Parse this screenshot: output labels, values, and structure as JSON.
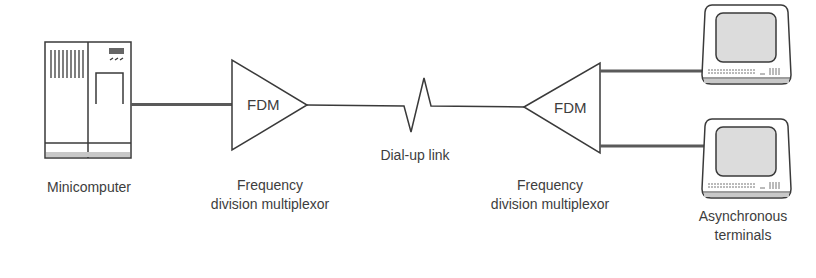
{
  "diagram": {
    "nodes": {
      "minicomputer": {
        "label": "Minicomputer"
      },
      "fdm_left": {
        "box_label": "FDM",
        "caption_line1": "Frequency",
        "caption_line2": "division multiplexor"
      },
      "link": {
        "label": "Dial-up link"
      },
      "fdm_right": {
        "box_label": "FDM",
        "caption_line1": "Frequency",
        "caption_line2": "division multiplexor"
      },
      "terminals": {
        "caption_line1": "Asynchronous",
        "caption_line2": "terminals",
        "count": 2
      }
    },
    "edges": [
      {
        "from": "minicomputer",
        "to": "fdm_left",
        "style": "thick"
      },
      {
        "from": "fdm_left",
        "to": "fdm_right",
        "style": "thin",
        "via": "dial-up link"
      },
      {
        "from": "fdm_right",
        "to": "terminal_1",
        "style": "thick"
      },
      {
        "from": "fdm_right",
        "to": "terminal_2",
        "style": "thick"
      }
    ],
    "colors": {
      "stroke": "#3a3a3a",
      "thick_line": "#5a5a5a",
      "screen_fill": "#dcdcdc",
      "base_fill": "#c8c8c8"
    }
  }
}
